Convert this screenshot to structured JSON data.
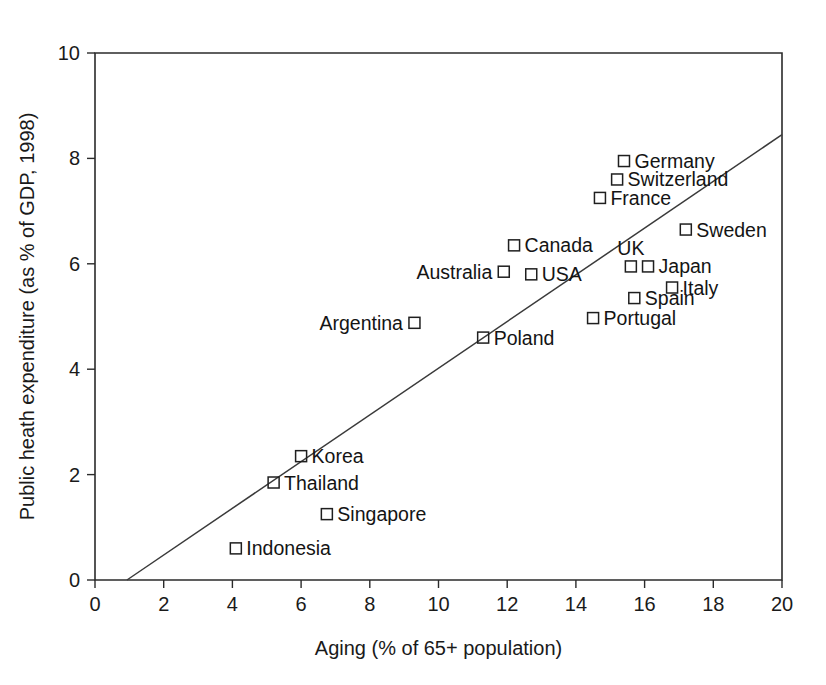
{
  "chart_data": {
    "type": "scatter",
    "title": "",
    "xlabel": "Aging (% of 65+ population)",
    "ylabel": "Public heath expenditure (as % of GDP, 1998)",
    "xlim": [
      0,
      20
    ],
    "ylim": [
      0,
      10
    ],
    "xticks": [
      "0",
      "2",
      "4",
      "6",
      "8",
      "10",
      "12",
      "14",
      "16",
      "18",
      "20"
    ],
    "yticks": [
      "0",
      "2",
      "4",
      "6",
      "8",
      "10"
    ],
    "grid": false,
    "legend": "none",
    "marker_style": "open-square",
    "points": [
      {
        "label": "Germany",
        "x": 15.4,
        "y": 7.95,
        "label_side": "right"
      },
      {
        "label": "Switzerland",
        "x": 15.2,
        "y": 7.6,
        "label_side": "right"
      },
      {
        "label": "France",
        "x": 14.7,
        "y": 7.25,
        "label_side": "right"
      },
      {
        "label": "Sweden",
        "x": 17.2,
        "y": 6.65,
        "label_side": "right"
      },
      {
        "label": "Canada",
        "x": 12.2,
        "y": 6.35,
        "label_side": "right"
      },
      {
        "label": "UK",
        "x": 15.6,
        "y": 5.95,
        "label_side": "above"
      },
      {
        "label": "Japan",
        "x": 16.1,
        "y": 5.95,
        "label_side": "right"
      },
      {
        "label": "Australia",
        "x": 11.9,
        "y": 5.85,
        "label_side": "left"
      },
      {
        "label": "USA",
        "x": 12.7,
        "y": 5.8,
        "label_side": "right"
      },
      {
        "label": "Italy",
        "x": 16.8,
        "y": 5.55,
        "label_side": "right"
      },
      {
        "label": "Spain",
        "x": 15.7,
        "y": 5.35,
        "label_side": "right"
      },
      {
        "label": "Portugal",
        "x": 14.5,
        "y": 4.97,
        "label_side": "right"
      },
      {
        "label": "Argentina",
        "x": 9.3,
        "y": 4.88,
        "label_side": "left"
      },
      {
        "label": "Poland",
        "x": 11.3,
        "y": 4.6,
        "label_side": "right"
      },
      {
        "label": "Korea",
        "x": 6.0,
        "y": 2.35,
        "label_side": "right"
      },
      {
        "label": "Thailand",
        "x": 5.2,
        "y": 1.85,
        "label_side": "right"
      },
      {
        "label": "Singapore",
        "x": 6.75,
        "y": 1.25,
        "label_side": "right"
      },
      {
        "label": "Indonesia",
        "x": 4.1,
        "y": 0.6,
        "label_side": "right"
      }
    ],
    "trend_line": {
      "x_start": 0.93,
      "y_start": 0.0,
      "x_end": 20.0,
      "y_end": 8.45
    },
    "colors": {
      "axis": "#2b2b2b",
      "marker": "#1f1f1f",
      "trend": "#3a3a3a",
      "text": "#1a1a1a",
      "background": "#ffffff"
    }
  }
}
